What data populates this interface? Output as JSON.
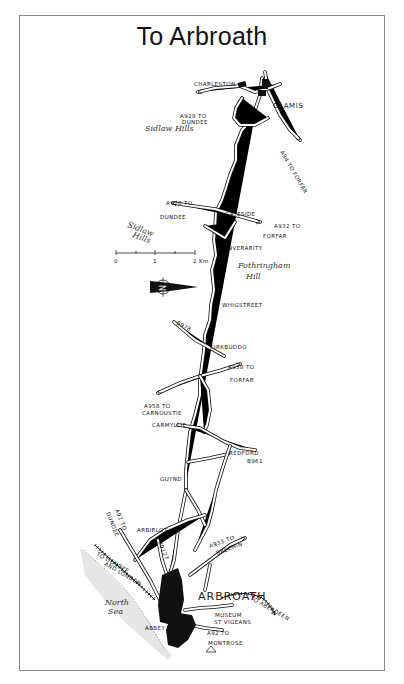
{
  "title": "To Arbroath",
  "scale_bar": {
    "ticks": [
      "0",
      "1",
      "2 Km"
    ]
  },
  "compass": {
    "name": "north-arrow",
    "letter": "N"
  },
  "places": {
    "charleston": "CHARLESTON",
    "glamis": "GLAMIS",
    "gateside": "GATESIDE",
    "inverarity": "INVERARITY",
    "whigstreet": "WHIGSTREET",
    "kirkbuddo": "KIRKBUDDO",
    "carmyllie": "CARMYLLIE",
    "redford": "REDFORD",
    "guynd": "GUYND",
    "arbirlot": "ARBIRLOT",
    "arbroath": "ARBROATH",
    "abbey": "ABBEY",
    "museum": "MUSEUM",
    "st_vigeans": "ST VIGEANS"
  },
  "hills": {
    "sidlaw_1": "Sidlaw Hills",
    "sidlaw_2_line1": "Sidlaw",
    "sidlaw_2_line2": "Hills",
    "fothringham_line1": "Fothringham",
    "fothringham_line2": "Hill"
  },
  "sea": {
    "line1": "North",
    "line2": "Sea"
  },
  "roads": {
    "a928_dundee_top_1": "A928 TO",
    "a928_dundee_top_2": "DUNDEE",
    "a94_forfar": "A94 TO FORFAR",
    "a928_dundee_mid_1": "A928 TO",
    "a928_dundee_mid_2": "DUNDEE",
    "a932_forfar_1": "A932 TO",
    "a932_forfar_2": "FORFAR",
    "b978": "B978",
    "a958_forfar_1": "A958 TO",
    "a958_forfar_2": "FORFAR",
    "a958_carnoustie_1": "A958 TO",
    "a958_carnoustie_2": "CARNOUSTIE",
    "b961": "B961",
    "a92_dundee_1": "A92 TO",
    "a92_dundee_2": "DUNDEE",
    "b9127": "B9127",
    "a933_brechin_1": "A933 TO",
    "a933_brechin_2": "BRECHIN",
    "rail_dundee_1": "TO DUNDEE",
    "rail_dundee_2": "AND LONDON",
    "rail_aberdeen": "TO ABERDEEN",
    "a92_montrose_1": "A92 TO",
    "a92_montrose_2": "MONTROSE"
  }
}
